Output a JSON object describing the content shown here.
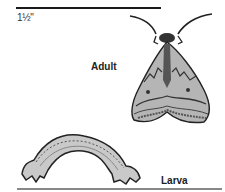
{
  "figure": {
    "scale": {
      "label": "1½\""
    },
    "stages": [
      {
        "label": "Adult",
        "icon": "moth-illustration"
      },
      {
        "label": "Larva",
        "icon": "caterpillar-illustration"
      }
    ]
  },
  "colors": {
    "ink": "#1a1a1a",
    "wing_fill": "#b8b8b8",
    "rule": "#888888"
  }
}
